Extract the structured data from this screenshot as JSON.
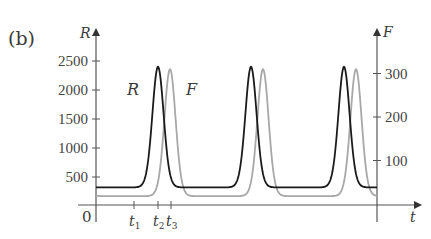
{
  "panel_label": "(b)",
  "chart_data": {
    "type": "line",
    "title": "",
    "panel": "(b)",
    "xlabel": "t",
    "ylabel_left": "R",
    "ylabel_right": "F",
    "origin_label": "0",
    "x_ticks": [
      {
        "t": 38,
        "label": "t",
        "sub": "1"
      },
      {
        "t": 62,
        "label": "t",
        "sub": "2"
      },
      {
        "t": 75,
        "label": "t",
        "sub": "3"
      }
    ],
    "xlim": [
      0,
      281
    ],
    "left_axis": {
      "label": "R",
      "ticks": [
        500,
        1000,
        1500,
        2000,
        2500
      ],
      "ylim": [
        0,
        2800
      ]
    },
    "right_axis": {
      "label": "F",
      "ticks": [
        100,
        200,
        300
      ],
      "ylim": [
        0,
        400
      ]
    },
    "grid": false,
    "legend": "inline labels",
    "annotations": [
      {
        "text": "R",
        "near_series": "R"
      },
      {
        "text": "F",
        "near_series": "F"
      }
    ],
    "series": [
      {
        "name": "R",
        "axis": "left",
        "color": "#1a1a1a",
        "period": 93,
        "min": 320,
        "max": 2400,
        "peak_times": [
          62,
          155,
          248
        ],
        "min_times": [
          0,
          94,
          187,
          280
        ],
        "start_value": 320,
        "end_value": 340
      },
      {
        "name": "F",
        "axis": "right",
        "color": "#a8a8a8",
        "period": 93,
        "min": 18,
        "max": 310,
        "peak_times": [
          74,
          167,
          260
        ],
        "min_times": [
          38,
          134,
          226
        ],
        "start_value": 95,
        "end_value": 110
      }
    ]
  }
}
